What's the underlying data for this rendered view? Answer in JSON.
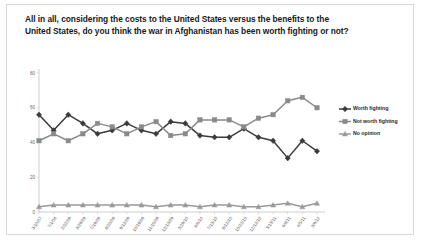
{
  "title": "All in all, considering the costs to the United States versus the benefits to the United States, do you think the war in Afghanistan has been worth fighting or not?",
  "colors": {
    "worth_fighting": "#3b3b3b",
    "not_worth_fighting": "#8a8a8a",
    "no_opinion": "#9a9a9a",
    "axis": "#b9b9b9",
    "frame": "#d8d8d8",
    "background": "#ffffff",
    "title_text": "#1a1a1a"
  },
  "legend": {
    "position": "right",
    "items": [
      {
        "label": "Worth fighting",
        "marker": "diamond",
        "color": "#3b3b3b"
      },
      {
        "label": "Not worth fighting",
        "marker": "square",
        "color": "#8a8a8a"
      },
      {
        "label": "No opinion",
        "marker": "triangle",
        "color": "#9a9a9a"
      }
    ]
  },
  "chart_data": {
    "type": "line",
    "title": "All in all, considering the costs to the United States versus the benefits to the United States, do you think the war in Afghanistan has been worth fighting or not?",
    "xlabel": "",
    "ylabel": "",
    "ylim": [
      0,
      80
    ],
    "yticks": [
      0,
      20,
      40,
      60,
      80
    ],
    "grid": false,
    "legend_position": "right",
    "categories": [
      "3/10/07",
      "7/1/08",
      "2/22/09",
      "3/29/09",
      "7/19/09",
      "8/20/09",
      "9/12/09",
      "10/19/09",
      "11/15/09",
      "12/13/09",
      "3/29/10",
      "6/6/10",
      "7/13/10",
      "8/12/10",
      "10/22/10",
      "12/12/10",
      "3/13/11",
      "6/9/11",
      "4/5/11",
      "3/9/12"
    ],
    "series": [
      {
        "name": "Worth fighting",
        "marker": "diamond",
        "color": "#3b3b3b",
        "values": [
          56,
          47,
          56,
          51,
          45,
          47,
          51,
          47,
          45,
          52,
          51,
          44,
          43,
          43,
          48,
          43,
          41,
          31,
          41,
          35
        ]
      },
      {
        "name": "Not worth fighting",
        "marker": "square",
        "color": "#8a8a8a",
        "values": [
          41,
          45,
          41,
          45,
          51,
          49,
          45,
          49,
          52,
          44,
          45,
          53,
          53,
          53,
          49,
          54,
          56,
          64,
          66,
          60
        ]
      },
      {
        "name": "No opinion",
        "marker": "triangle",
        "color": "#9a9a9a",
        "values": [
          3,
          4,
          4,
          4,
          4,
          4,
          4,
          4,
          3,
          4,
          4,
          3,
          4,
          4,
          3,
          3,
          4,
          5,
          3,
          5
        ]
      }
    ]
  }
}
